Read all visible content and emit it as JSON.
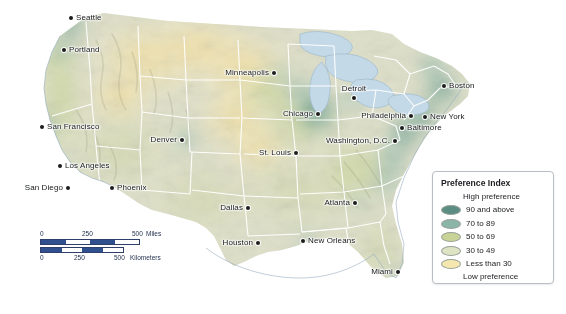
{
  "map": {
    "title": "United States Preference Index Choropleth Map",
    "projection_note": "Contiguous United States",
    "colors": {
      "background": "#ffffff",
      "water": "#c3d9e7",
      "state_border": "#ffffff",
      "coast_line": "#8fa8bd",
      "band_90_plus": "#5c8d82",
      "band_70_89": "#8bb5a7",
      "band_50_69": "#c3cf93",
      "band_30_49": "#d8dfc2",
      "band_lt_30": "#f2e6ae",
      "land_base": "#dcdcc8",
      "relief_shadow": "#b9b9a2"
    },
    "cities": [
      {
        "name": "Seattle",
        "x": 71,
        "y": 18,
        "pos": "r"
      },
      {
        "name": "Portland",
        "x": 64,
        "y": 50,
        "pos": "r"
      },
      {
        "name": "San Francisco",
        "x": 42,
        "y": 127,
        "pos": "r"
      },
      {
        "name": "Los Angeles",
        "x": 60,
        "y": 166,
        "pos": "r"
      },
      {
        "name": "San Diego",
        "x": 68,
        "y": 188,
        "pos": "l"
      },
      {
        "name": "Phoenix",
        "x": 112,
        "y": 188,
        "pos": "r"
      },
      {
        "name": "Denver",
        "x": 182,
        "y": 140,
        "pos": "l"
      },
      {
        "name": "Minneapolis",
        "x": 274,
        "y": 73,
        "pos": "l"
      },
      {
        "name": "Chicago",
        "x": 318,
        "y": 114,
        "pos": "l"
      },
      {
        "name": "St. Louis",
        "x": 296,
        "y": 153,
        "pos": "l"
      },
      {
        "name": "Detroit",
        "x": 354,
        "y": 98,
        "pos": "t"
      },
      {
        "name": "Dallas",
        "x": 248,
        "y": 208,
        "pos": "l"
      },
      {
        "name": "Houston",
        "x": 258,
        "y": 243,
        "pos": "l"
      },
      {
        "name": "New Orleans",
        "x": 303,
        "y": 241,
        "pos": "r"
      },
      {
        "name": "Atlanta",
        "x": 355,
        "y": 203,
        "pos": "l"
      },
      {
        "name": "Miami",
        "x": 398,
        "y": 272,
        "pos": "l"
      },
      {
        "name": "Washington, D.C.",
        "x": 395,
        "y": 141,
        "pos": "l"
      },
      {
        "name": "Baltimore",
        "x": 402,
        "y": 128,
        "pos": "r"
      },
      {
        "name": "Philadelphia",
        "x": 411,
        "y": 116,
        "pos": "l"
      },
      {
        "name": "New York",
        "x": 425,
        "y": 117,
        "pos": "r"
      },
      {
        "name": "Boston",
        "x": 444,
        "y": 86,
        "pos": "r"
      }
    ]
  },
  "scale_bar": {
    "miles": {
      "ticks": [
        "0",
        "250",
        "500"
      ],
      "unit": "Miles"
    },
    "kilometers": {
      "ticks": [
        "0",
        "250",
        "500"
      ],
      "unit": "Kilometers"
    },
    "bar_fill": "#2f4f8f",
    "bar_empty": "#ffffff"
  },
  "legend": {
    "title": "Preference Index",
    "high_label": "High preference",
    "low_label": "Low preference",
    "items": [
      {
        "label": "90 and above",
        "color": "#5c8d82"
      },
      {
        "label": "70 to 89",
        "color": "#8bb5a7"
      },
      {
        "label": "50 to 69",
        "color": "#c9d397"
      },
      {
        "label": "30 to 49",
        "color": "#dde3c3"
      },
      {
        "label": "Less than 30",
        "color": "#f4e8b0"
      }
    ]
  },
  "chart_data": {
    "type": "heatmap",
    "title": "Preference Index",
    "subtitle": "Contiguous United States choropleth",
    "legend_position": "bottom-right",
    "value_classes": [
      {
        "label": "90 and above",
        "min": 90,
        "max": 100,
        "color": "#5c8d82"
      },
      {
        "label": "70 to 89",
        "min": 70,
        "max": 89,
        "color": "#8bb5a7"
      },
      {
        "label": "50 to 69",
        "min": 50,
        "max": 69,
        "color": "#c9d397"
      },
      {
        "label": "30 to 49",
        "min": 30,
        "max": 49,
        "color": "#dde3c3"
      },
      {
        "label": "Less than 30",
        "min": 0,
        "max": 29,
        "color": "#f4e8b0"
      }
    ],
    "regions": [
      {
        "name": "Puget Sound / Seattle",
        "class": "90 and above"
      },
      {
        "name": "Portland / Willamette",
        "class": "70 to 89"
      },
      {
        "name": "San Francisco Bay Area",
        "class": "90 and above"
      },
      {
        "name": "Los Angeles coast",
        "class": "70 to 89"
      },
      {
        "name": "San Diego coast",
        "class": "70 to 89"
      },
      {
        "name": "Coastal California strip",
        "class": "50 to 69"
      },
      {
        "name": "Denver Front Range",
        "class": "70 to 89"
      },
      {
        "name": "Montana / Idaho / Wyoming",
        "class": "Less than 30"
      },
      {
        "name": "Dakotas / Nebraska plains",
        "class": "Less than 30"
      },
      {
        "name": "Arizona / Nevada / Utah",
        "class": "30 to 49"
      },
      {
        "name": "Texas interior",
        "class": "30 to 49"
      },
      {
        "name": "Minneapolis metro",
        "class": "70 to 89"
      },
      {
        "name": "Chicago / Lake Michigan",
        "class": "90 and above"
      },
      {
        "name": "Detroit / Michigan",
        "class": "70 to 89"
      },
      {
        "name": "St. Louis / Missouri",
        "class": "30 to 49"
      },
      {
        "name": "Atlanta metro",
        "class": "70 to 89"
      },
      {
        "name": "New Orleans / Gulf coast",
        "class": "70 to 89"
      },
      {
        "name": "Washington D.C. - Boston corridor",
        "class": "90 and above"
      },
      {
        "name": "Virginia / Carolina coast",
        "class": "70 to 89"
      },
      {
        "name": "Florida peninsula",
        "class": "30 to 49"
      },
      {
        "name": "Miami / South Florida",
        "class": "70 to 89"
      },
      {
        "name": "Appalachian interior",
        "class": "50 to 69"
      },
      {
        "name": "Great Plains interior",
        "class": "Less than 30"
      }
    ]
  }
}
